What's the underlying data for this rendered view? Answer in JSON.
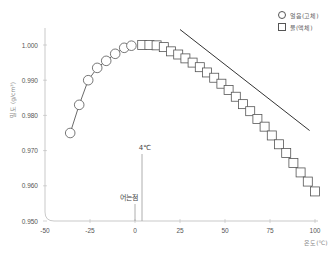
{
  "chart_data": {
    "type": "scatter",
    "title": "",
    "xlabel": "온도(℃)",
    "ylabel": "밀도 (g/cm³)",
    "xlim": [
      -50,
      100
    ],
    "ylim": [
      0.95,
      1.005
    ],
    "x_ticks": [
      "-50",
      "-25",
      "0",
      "25",
      "50",
      "75",
      "100"
    ],
    "y_ticks": [
      "0.950",
      "0.960",
      "0.970",
      "0.980",
      "0.990",
      "1.000"
    ],
    "grid": false,
    "legend_position": "top-right",
    "series": [
      {
        "name": "얼음(고체)",
        "marker": "circle",
        "connected": true,
        "x": [
          -36,
          -31,
          -26,
          -21,
          -16,
          -11,
          -6,
          -2
        ],
        "y": [
          0.975,
          0.983,
          0.99,
          0.9935,
          0.9955,
          0.9975,
          0.9992,
          0.9998
        ]
      },
      {
        "name": "물(액체)",
        "marker": "square",
        "connected": true,
        "x": [
          4,
          8,
          12,
          16,
          20,
          24,
          28,
          32,
          36,
          40,
          44,
          48,
          52,
          56,
          60,
          64,
          68,
          72,
          76,
          80,
          84,
          88,
          92,
          96,
          100
        ],
        "y": [
          1.0,
          1.0,
          0.9999,
          0.9994,
          0.9982,
          0.9973,
          0.9962,
          0.995,
          0.9937,
          0.9922,
          0.9907,
          0.989,
          0.9872,
          0.9853,
          0.9832,
          0.9812,
          0.979,
          0.9768,
          0.9743,
          0.9718,
          0.9693,
          0.9665,
          0.9638,
          0.9612,
          0.9584
        ]
      }
    ],
    "annotations": [
      {
        "text": "4℃",
        "x": 4
      },
      {
        "text": "어는점",
        "x": 0
      },
      {
        "text": "trend line",
        "from": [
          25,
          1.0044
        ],
        "to": [
          97,
          0.9757
        ]
      }
    ]
  },
  "legend": {
    "ice": "얼음(고체)",
    "water": "물(액체)"
  },
  "axes": {
    "xlabel": "온도(℃)",
    "ylabel": "밀도 (g/cm³)",
    "x_ticks": [
      "-50",
      "-25",
      "0",
      "25",
      "50",
      "75",
      "100"
    ],
    "y_ticks": [
      "1.000",
      "0.990",
      "0.980",
      "0.970",
      "0.960",
      "0.950"
    ]
  },
  "annotations": {
    "max_density": "4℃",
    "freezing_point": "어는점"
  }
}
